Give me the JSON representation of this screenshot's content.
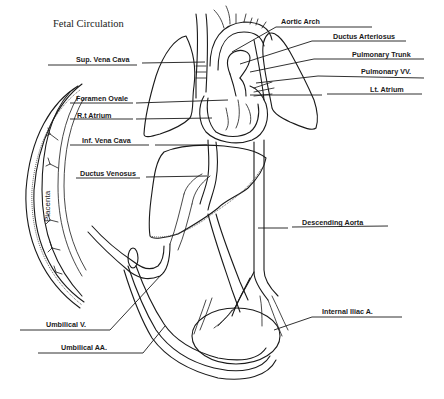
{
  "diagram": {
    "title": "Fetal Circulation",
    "placenta_label": "Placenta",
    "labels_left": [
      {
        "id": "sup-vena-cava",
        "text": "Sup. Vena Cava"
      },
      {
        "id": "foramen-ovale",
        "text": "Foramen Ovale"
      },
      {
        "id": "rt-atrium",
        "text": "R.t Atrium"
      },
      {
        "id": "inf-vena-cava",
        "text": "Inf. Vena Cava"
      },
      {
        "id": "ductus-venosus",
        "text": "Ductus Venosus"
      },
      {
        "id": "umbilical-v",
        "text": "Umbilical V."
      },
      {
        "id": "umbilical-aa",
        "text": "Umbilical AA."
      }
    ],
    "labels_right": [
      {
        "id": "aortic-arch",
        "text": "Aortic Arch"
      },
      {
        "id": "ductus-arteriosus",
        "text": "Ductus Arteriosus"
      },
      {
        "id": "pulmonary-trunk",
        "text": "Pulmonary Trunk"
      },
      {
        "id": "pulmonary-vv",
        "text": "Pulmonary VV."
      },
      {
        "id": "lt-atrium",
        "text": "Lt. Atrium"
      },
      {
        "id": "descending-aorta",
        "text": "Descending Aorta"
      },
      {
        "id": "internal-iliac-a",
        "text": "Internal Iliac A."
      }
    ]
  }
}
